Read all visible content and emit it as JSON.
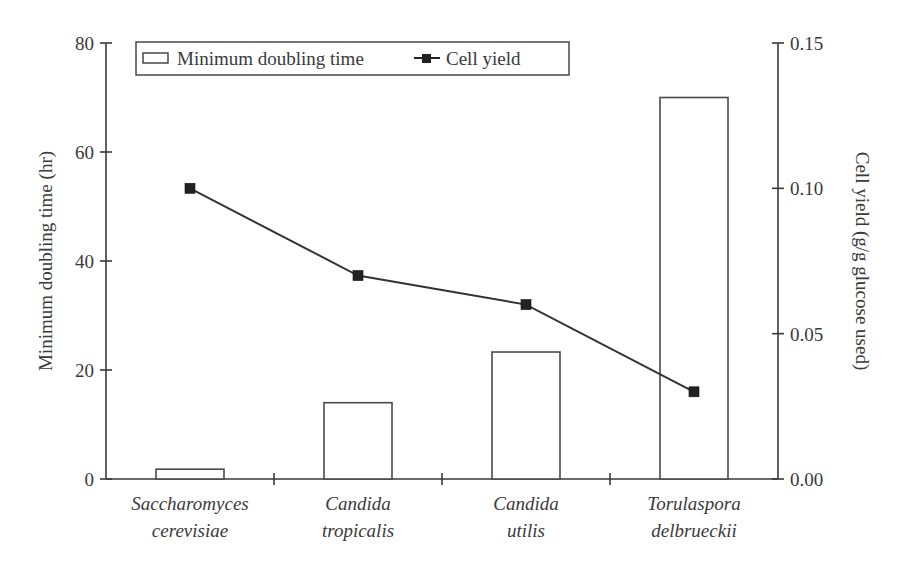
{
  "chart_data": {
    "type": "bar",
    "title": "",
    "categories": [
      "Saccharomyces cerevisiae",
      "Candida tropicalis",
      "Candida utilis",
      "Torulaspora delbrueckii"
    ],
    "category_lines": [
      [
        "Saccharomyces",
        "cerevisiae"
      ],
      [
        "Candida",
        "tropicalis"
      ],
      [
        "Candida",
        "utilis"
      ],
      [
        "Torulaspora",
        "delbrueckii"
      ]
    ],
    "series": [
      {
        "name": "Minimum doubling time",
        "type": "bar",
        "axis": "left",
        "values": [
          1.8,
          14,
          23.3,
          70
        ]
      },
      {
        "name": "Cell yield",
        "type": "line",
        "marker": "square",
        "axis": "right",
        "values": [
          0.1,
          0.07,
          0.06,
          0.03
        ]
      }
    ],
    "xlabel": "",
    "ylabel": "Minimum doubling time (hr)",
    "ylabel_right": "Cell yield (g/g glucose used)",
    "ylim": [
      0,
      80
    ],
    "ylim_right": [
      0,
      0.15
    ],
    "yticks": [
      "0",
      "20",
      "40",
      "60",
      "80"
    ],
    "yticks_right": [
      "0.00",
      "0.05",
      "0.10",
      "0.15"
    ],
    "grid": false,
    "legend_position": "top-inside",
    "legend": [
      "Minimum doubling time",
      "Cell yield"
    ]
  }
}
